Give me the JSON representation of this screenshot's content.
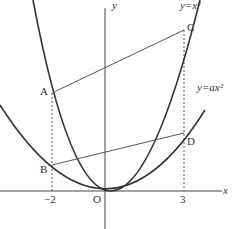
{
  "diagram": {
    "axes": {
      "x_label": "x",
      "y_label": "y",
      "origin_label": "O"
    },
    "curves": [
      {
        "name": "steep",
        "label": "y=x²",
        "a": 1
      },
      {
        "name": "wide",
        "label": "y=ax²"
      }
    ],
    "points": {
      "A": "A",
      "B": "B",
      "C": "C",
      "D": "D"
    },
    "ticks": {
      "left": "−2",
      "right": "3"
    }
  }
}
